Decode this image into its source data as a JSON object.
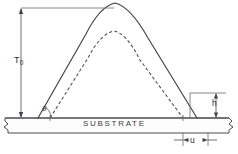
{
  "figure": {
    "kind": "cross-section-profile-diagram",
    "background_color": "#ffffff",
    "line_color": "#4a4a52",
    "width_px": 238,
    "height_px": 154
  },
  "labels": {
    "total_thickness": "T",
    "total_thickness_subscript": "0",
    "angle": "θ",
    "foot_height": "h",
    "foot_width": "u",
    "substrate": "SUBSTRATE"
  },
  "dimensions": {
    "T0": {
      "name": "T",
      "subscript": "0",
      "meaning": "total-resist-thickness",
      "orientation": "vertical",
      "from_y": 8,
      "to_y": 118,
      "x": 21
    },
    "theta": {
      "name": "θ",
      "meaning": "sidewall-angle",
      "vertex_x": 38,
      "vertex_y": 118,
      "arc_radius": 11
    },
    "h": {
      "name": "h",
      "meaning": "foot-height",
      "orientation": "vertical",
      "from_y": 93,
      "to_y": 118,
      "x": 216
    },
    "u": {
      "name": "u",
      "meaning": "foot-width",
      "orientation": "horizontal",
      "from_x": 183,
      "to_x": 208,
      "y": 140
    }
  },
  "curves": {
    "solid_profile": {
      "style": "solid",
      "meaning": "as-developed-resist-profile",
      "left_foot_x": 38,
      "right_foot_x": 197,
      "peak_x": 115,
      "peak_y": 3
    },
    "dashed_profile": {
      "style": "dashed",
      "meaning": "reference-or-eroded-profile",
      "left_foot_x": 50,
      "right_foot_x": 183,
      "peak_x": 114,
      "peak_y": 31
    }
  },
  "substrate": {
    "label": "SUBSTRATE",
    "top_y": 118,
    "bottom_y": 133,
    "left_x": 4,
    "right_x": 234,
    "break_symbols": [
      "left",
      "right"
    ]
  }
}
